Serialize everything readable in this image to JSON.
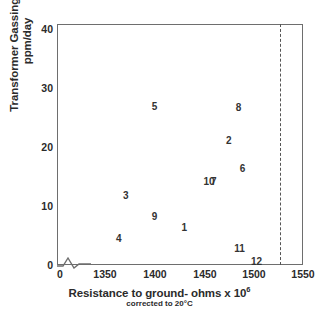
{
  "chart_data": {
    "type": "scatter",
    "title": "",
    "xlabel": "Resistance to ground- ohms x 10^6",
    "xlabel_main": "Resistance to ground- ohms x 10",
    "xlabel_exponent": "6",
    "xlabel_sub": "corrected to 20°C",
    "ylabel_line1": "Transformer Gassing Rate",
    "ylabel_line2": "ppm/day",
    "xlim": [
      1330,
      1550
    ],
    "ylim": [
      0,
      42
    ],
    "x_axis_break": true,
    "grid": false,
    "legend": "none",
    "xticks": [
      {
        "label": "0",
        "value": 0,
        "px": 60
      },
      {
        "label": "1350",
        "value": 1350,
        "px": 105
      },
      {
        "label": "1400",
        "value": 1400,
        "px": 155
      },
      {
        "label": "1450",
        "value": 1450,
        "px": 205
      },
      {
        "label": "1500",
        "value": 1500,
        "px": 254
      },
      {
        "label": "1550",
        "value": 1550,
        "px": 303
      }
    ],
    "yticks": [
      {
        "label": "0",
        "value": 0
      },
      {
        "label": "10",
        "value": 10
      },
      {
        "label": "20",
        "value": 20
      },
      {
        "label": "30",
        "value": 30
      },
      {
        "label": "40",
        "value": 40
      }
    ],
    "annotations": [
      {
        "label": "reference-line",
        "type": "vertical-dashed",
        "x": 1527
      }
    ],
    "points": [
      {
        "label": "5",
        "x": 1400,
        "y": 27.0
      },
      {
        "label": "8",
        "x": 1485,
        "y": 26.8
      },
      {
        "label": "2",
        "x": 1475,
        "y": 21.2
      },
      {
        "label": "6",
        "x": 1489,
        "y": 16.5
      },
      {
        "label": "7",
        "x": 1460,
        "y": 14.3
      },
      {
        "label": "10",
        "x": 1455,
        "y": 14.3
      },
      {
        "label": "3",
        "x": 1371,
        "y": 11.8
      },
      {
        "label": "9",
        "x": 1400,
        "y": 8.3
      },
      {
        "label": "1",
        "x": 1430,
        "y": 6.5
      },
      {
        "label": "4",
        "x": 1364,
        "y": 4.5
      },
      {
        "label": "11",
        "x": 1486,
        "y": 2.8
      },
      {
        "label": "12",
        "x": 1503,
        "y": 0.6
      }
    ]
  },
  "colors": {
    "axis": "#6e6e6e",
    "text": "#2b2b2b",
    "point_label": "#333333",
    "background": "#ffffff",
    "dashed": "#555555"
  }
}
